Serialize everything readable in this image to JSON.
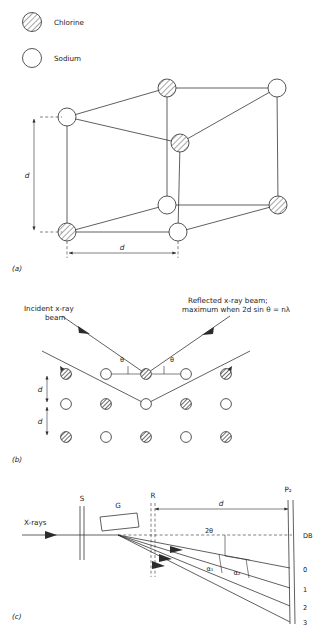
{
  "figure": {
    "parts": [
      {
        "id": "a",
        "label": "(a)",
        "caption": "Cubic lattice of sodium chloride"
      },
      {
        "id": "b",
        "label": "(b)",
        "caption": "Bragg reflection from lattice planes"
      },
      {
        "id": "c",
        "label": "(c)",
        "caption": "X-ray spectrometer arrangement"
      }
    ]
  },
  "legend": {
    "items": [
      {
        "symbol": "hatched-circle",
        "label": "Chlorine"
      },
      {
        "symbol": "open-circle",
        "label": "Sodium"
      }
    ]
  },
  "part_a": {
    "part_label": "(a)",
    "dimension_vertical": "d",
    "dimension_horizontal": "d",
    "vertices": [
      {
        "id": "back-top-left",
        "type": "Sodium",
        "x": 67,
        "y": 117
      },
      {
        "id": "back-top-mid",
        "type": "Chlorine",
        "x": 167,
        "y": 88
      },
      {
        "id": "back-top-right",
        "type": "Sodium",
        "x": 277,
        "y": 88
      },
      {
        "id": "front-top-right",
        "type": "Chlorine",
        "x": 180,
        "y": 143
      },
      {
        "id": "front-mid",
        "type": "Sodium",
        "x": 167,
        "y": 205
      },
      {
        "id": "front-right",
        "type": "Chlorine",
        "x": 278,
        "y": 205
      },
      {
        "id": "bottom-left",
        "type": "Chlorine",
        "x": 67,
        "y": 232
      },
      {
        "id": "bottom-mid",
        "type": "Sodium",
        "x": 178,
        "y": 232
      }
    ]
  },
  "part_b": {
    "part_label": "(b)",
    "incident_label": "Incident x-ray\nbeam",
    "incident_label_line1": "Incident x-ray",
    "incident_label_line2": "beam",
    "reflected_label_line1": "Reflected x-ray beam;",
    "reflected_label_line2": "maximum when 2d sin θ = nλ",
    "angle_left": "θ",
    "angle_right": "θ",
    "spacing_upper": "d",
    "spacing_lower": "d",
    "rows": [
      {
        "y": 374,
        "atoms": [
          "Chlorine",
          "Sodium",
          "Chlorine",
          "Sodium",
          "Chlorine"
        ]
      },
      {
        "y": 404,
        "atoms": [
          "Sodium",
          "Chlorine",
          "Sodium",
          "Chlorine",
          "Sodium"
        ]
      },
      {
        "y": 437,
        "atoms": [
          "Chlorine",
          "Sodium",
          "Chlorine",
          "Sodium",
          "Chlorine"
        ]
      }
    ],
    "row_x": [
      66,
      106,
      146,
      186,
      226
    ]
  },
  "part_c": {
    "part_label": "(c)",
    "source_label": "X-rays",
    "slit_label": "S",
    "crystal_label": "G",
    "second_slit_label": "R",
    "plate_label": "P₂",
    "distance_label": "d",
    "angle_2theta": "2θ",
    "alpha_1": "α₁",
    "alpha_2": "α₂",
    "plate_marks": [
      "DB",
      "0",
      "1",
      "2",
      "3"
    ],
    "order_labels": [
      "0",
      "1",
      "2",
      "3"
    ],
    "direct_beam_label": "DB"
  },
  "colors": {
    "ink": "#2b2b2b",
    "paper": "#ffffff",
    "hatch": "#3a3a3a"
  }
}
